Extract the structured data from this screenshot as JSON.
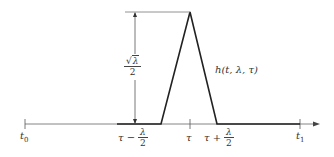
{
  "diagram": {
    "type": "triangular-pulse",
    "function_label": "h(t, λ, τ)",
    "height_label": {
      "numerator": "√λ",
      "radicand": "λ",
      "denominator": "2"
    },
    "axis_labels": {
      "start": {
        "base": "t",
        "sub": "0"
      },
      "end": {
        "base": "t",
        "sub": "1"
      },
      "center": "τ",
      "left_foot": {
        "prefix": "τ −",
        "numerator": "λ",
        "denominator": "2"
      },
      "right_foot": {
        "prefix": "τ +",
        "numerator": "λ",
        "denominator": "2"
      }
    },
    "colors": {
      "axis": "#555555",
      "pulse": "#222222",
      "text": "#333333"
    }
  }
}
